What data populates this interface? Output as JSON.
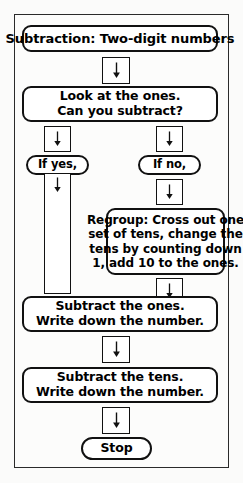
{
  "diagram": {
    "title_node": {
      "text": "Subtraction: Two-digit numbers"
    },
    "decision_node": {
      "line1": "Look at the ones.",
      "line2": "Can you subtract?"
    },
    "branch_yes": {
      "label": "If yes,"
    },
    "branch_no": {
      "label": "If no,"
    },
    "regroup_node": {
      "line1": "Regroup: Cross out one",
      "line2": "set of tens, change the",
      "line3": "tens by counting down",
      "line4": "1, add 10 to the ones."
    },
    "subtract_ones_node": {
      "line1": "Subtract the ones.",
      "line2": "Write down the number."
    },
    "subtract_tens_node": {
      "line1": "Subtract the tens.",
      "line2": "Write down the number."
    },
    "stop_node": {
      "text": "Stop"
    },
    "connectors": {
      "arrow_glyph": "down-arrow",
      "count": 7
    },
    "colors": {
      "outline": "#111111",
      "frame": "#2a2a2a",
      "node_fill": "#ffffff",
      "page_background": "#fbfbfa",
      "text": "#000000"
    }
  }
}
